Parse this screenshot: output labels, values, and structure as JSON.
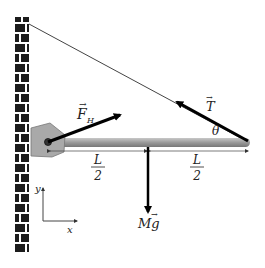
{
  "diagram": {
    "labels": {
      "hinge_force": "F",
      "hinge_force_sub": "H",
      "tension": "T",
      "angle": "θ",
      "weight": "Mg",
      "half_length_numerator": "L",
      "half_length_denominator": "2",
      "axis_x": "x",
      "axis_y": "y"
    },
    "colors": {
      "beam": "#9a9a9a",
      "bracket": "#a8a8a8",
      "brick": "#1a1a1a",
      "arrow": "#000000",
      "cable": "#333333"
    }
  }
}
